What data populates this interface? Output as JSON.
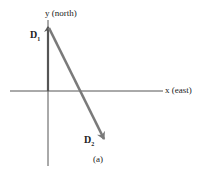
{
  "figure": {
    "caption": "(a)",
    "axes": {
      "x_label": "x (east)",
      "y_label": "y (north)"
    },
    "vectors": [
      {
        "name": "D",
        "subscript": "1",
        "color": "#555555",
        "direction": "north",
        "from": [
          0,
          0
        ],
        "to": [
          0,
          1
        ]
      },
      {
        "name": "D",
        "subscript": "2",
        "color": "#7a7a7a",
        "direction": "southeast",
        "from": [
          0,
          1
        ],
        "to": [
          0.9,
          -0.75
        ]
      }
    ],
    "colors": {
      "axis": "#555555",
      "vector_d1": "#555555",
      "vector_d2": "#7a7a7a",
      "text": "#222222"
    }
  }
}
